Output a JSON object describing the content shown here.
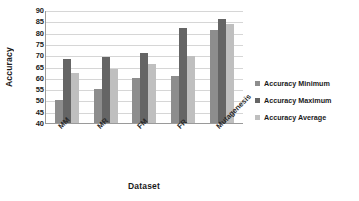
{
  "chart_data": {
    "type": "bar",
    "title": "",
    "subtitle": "",
    "xlabel": "Dataset",
    "ylabel": "Accuracy",
    "categories": [
      "MM",
      "MR",
      "FM",
      "FR",
      "Mutagenesis"
    ],
    "series": [
      {
        "name": "Accuracy Minimum",
        "color": "#8d8d8d",
        "values": [
          50,
          55,
          60,
          61,
          81
        ]
      },
      {
        "name": "Accuracy Maximum",
        "color": "#656565",
        "values": [
          68.5,
          69,
          71,
          82,
          86
        ]
      },
      {
        "name": "Accuracy Average",
        "color": "#bfbfbf",
        "values": [
          62,
          64,
          66,
          69.5,
          84
        ]
      }
    ],
    "ylim": [
      40,
      90
    ],
    "ytick_step": 5,
    "yticks": [
      90,
      85,
      80,
      75,
      70,
      65,
      60,
      55,
      50,
      45,
      40
    ],
    "grid": true,
    "grid_axis": "y",
    "legend_position": "right",
    "bar_orientation": "vertical",
    "xtick_rotation": -45
  },
  "axes": {
    "y_title": "Accuracy",
    "x_title": "Dataset"
  },
  "legend": {
    "items": [
      {
        "label": "Accuracy Minimum",
        "color": "#8d8d8d"
      },
      {
        "label": "Accuracy Maximum",
        "color": "#656565"
      },
      {
        "label": "Accuracy Average",
        "color": "#bfbfbf"
      }
    ]
  },
  "colors": {
    "gridline": "#d6d6d6",
    "axis": "#9a9a9a",
    "text": "#1a1a1a",
    "background": "#ffffff"
  }
}
